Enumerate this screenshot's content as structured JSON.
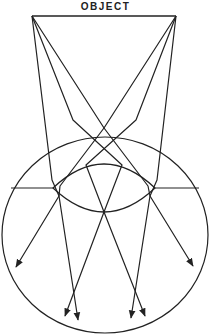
{
  "title_label": "OBJECT",
  "colors": {
    "stroke": "#222222",
    "background": "#ffffff"
  },
  "object_line": {
    "x1": 32,
    "y1": 16,
    "x2": 176,
    "y2": 16
  },
  "eye_circle": {
    "cx": 105,
    "cy": 235,
    "rx": 103,
    "ry": 98
  },
  "lens": {
    "left": [
      53,
      188
    ],
    "right": [
      155,
      188
    ],
    "top_y": 164,
    "bottom_y": 212
  },
  "axis_lines": [
    {
      "x1": 11,
      "y1": 188,
      "x2": 53,
      "y2": 188
    },
    {
      "x1": 155,
      "y1": 188,
      "x2": 199,
      "y2": 188
    }
  ],
  "rays": [
    {
      "name": "left-apex-ray-1",
      "points": [
        [
          32,
          16
        ],
        [
          52,
          180
        ],
        [
          59,
          196
        ],
        [
          78,
          320
        ]
      ]
    },
    {
      "name": "left-apex-ray-2",
      "points": [
        [
          32,
          16
        ],
        [
          73,
          120
        ],
        [
          122,
          165
        ],
        [
          104,
          212
        ],
        [
          65,
          316
        ]
      ]
    },
    {
      "name": "left-apex-ray-3",
      "points": [
        [
          32,
          16
        ],
        [
          104,
          128
        ],
        [
          148,
          186
        ],
        [
          150,
          196
        ],
        [
          193,
          266
        ]
      ]
    },
    {
      "name": "right-apex-ray-1",
      "points": [
        [
          176,
          16
        ],
        [
          157,
          180
        ],
        [
          150,
          196
        ],
        [
          131,
          318
        ]
      ]
    },
    {
      "name": "right-apex-ray-2",
      "points": [
        [
          176,
          16
        ],
        [
          136,
          120
        ],
        [
          86,
          165
        ],
        [
          104,
          212
        ],
        [
          145,
          316
        ]
      ]
    },
    {
      "name": "right-apex-ray-3",
      "points": [
        [
          176,
          16
        ],
        [
          104,
          128
        ],
        [
          60,
          186
        ],
        [
          59,
          196
        ],
        [
          16,
          267
        ]
      ]
    }
  ]
}
